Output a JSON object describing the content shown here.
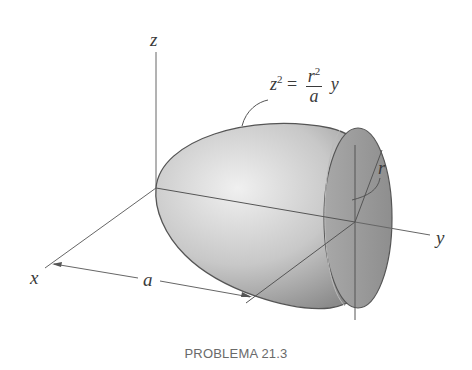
{
  "figure": {
    "caption": "PROBLEMA 21.3",
    "axes": {
      "x_label": "x",
      "y_label": "y",
      "z_label": "z"
    },
    "dimensions": {
      "length_label": "a",
      "radius_label": "r"
    },
    "equation": {
      "lhs": "z",
      "lhs_exp": "2",
      "equals": "=",
      "num": "r",
      "num_exp": "2",
      "den": "a",
      "rhs_var": "y"
    },
    "colors": {
      "body_light": "#ececec",
      "body_dark": "#8c8c8c",
      "face": "#9a9a9a",
      "line": "#555555"
    }
  }
}
